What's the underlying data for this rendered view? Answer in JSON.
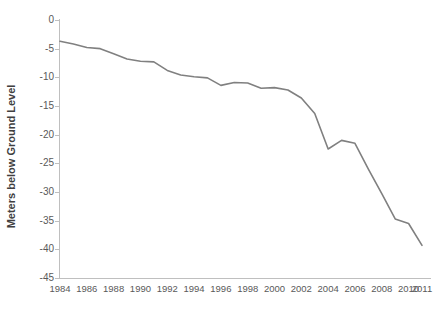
{
  "chart_data": {
    "type": "line",
    "title": "",
    "xlabel": "",
    "ylabel": "Meters below Ground Level",
    "xlim": [
      1984,
      2011
    ],
    "ylim": [
      -45,
      0
    ],
    "grid": false,
    "legend": null,
    "y_ticks": [
      0,
      -5,
      -10,
      -15,
      -20,
      -25,
      -30,
      -35,
      -40,
      -45
    ],
    "y_tick_labels": [
      "0",
      "-5",
      "-10",
      "-15",
      "-20",
      "-25",
      "-30",
      "-35",
      "-40",
      "-45"
    ],
    "x_tick_labels": [
      "1984",
      "1986",
      "1988",
      "1990",
      "1992",
      "1994",
      "1996",
      "1998",
      "2000",
      "2002",
      "2004",
      "2006",
      "2008",
      "2010",
      "2011"
    ],
    "line_color": "#808080",
    "line_width": 1.6,
    "series": [
      {
        "name": "Groundwater level",
        "x": [
          1984,
          1985,
          1986,
          1987,
          1988,
          1989,
          1990,
          1991,
          1992,
          1993,
          1994,
          1995,
          1996,
          1997,
          1998,
          1999,
          2000,
          2001,
          2002,
          2003,
          2004,
          2005,
          2006,
          2007,
          2008,
          2009,
          2010,
          2011
        ],
        "values": [
          -3.7,
          -4.2,
          -4.8,
          -5.0,
          -5.9,
          -6.8,
          -7.2,
          -7.3,
          -8.8,
          -9.6,
          -9.9,
          -10.1,
          -11.4,
          -10.9,
          -11.0,
          -11.9,
          -11.8,
          -12.2,
          -13.6,
          -16.3,
          -22.5,
          -21.0,
          -21.5,
          -26.0,
          -30.3,
          -34.7,
          -35.5,
          -39.3
        ]
      }
    ]
  }
}
